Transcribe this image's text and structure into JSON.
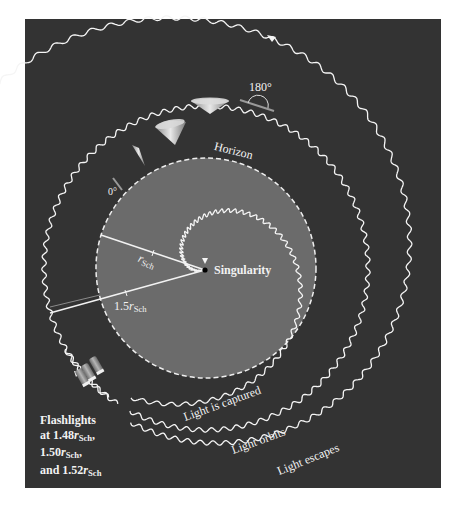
{
  "figure": {
    "background_color": "#333333",
    "horizon_fill": "#6b6b6b",
    "line_color": "#f5f5f5"
  },
  "labels": {
    "horizon": "Horizon",
    "angle_180": "180°",
    "angle_0": "0°",
    "singularity": "Singularity",
    "r_sch_symbol": "r",
    "r_sch_sub": "Sch",
    "one_point_five": "1.5",
    "light_captured": "Light is captured",
    "light_orbits": "Light orbits",
    "light_escapes": "Light escapes",
    "flashlights_line1": "Flashlights",
    "flashlights_line2_prefix": "at 1.48",
    "flashlights_line2_suffix": ",",
    "flashlights_line3_prefix": "1.50",
    "flashlights_line3_suffix": ",",
    "flashlights_line4_prefix": "and 1.52"
  },
  "geometry": {
    "center": [
      206,
      268
    ],
    "horizon_radius": 110,
    "photon_sphere_radius": 162,
    "flashlight_radii_rsch": [
      1.48,
      1.5,
      1.52
    ]
  }
}
